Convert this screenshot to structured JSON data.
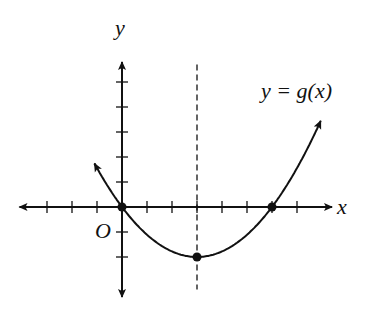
{
  "chart_data": {
    "type": "line",
    "title": "",
    "function_label": "y = g(x)",
    "xlabel": "x",
    "ylabel": "y",
    "origin_label": "O",
    "xlim": [
      -4,
      8
    ],
    "ylim": [
      -3,
      6
    ],
    "x_ticks": [
      -3,
      -2,
      -1,
      1,
      2,
      3,
      4,
      5,
      6,
      7
    ],
    "y_ticks": [
      -2,
      -1,
      1,
      2,
      3,
      4,
      5
    ],
    "grid": false,
    "axis_of_symmetry": {
      "x": 3,
      "style": "dashed"
    },
    "marked_points": [
      {
        "x": 0,
        "y": 0
      },
      {
        "x": 3,
        "y": -2
      },
      {
        "x": 6,
        "y": 0
      }
    ],
    "series": [
      {
        "name": "y = g(x)",
        "kind": "parabola",
        "vertex": [
          3,
          -2
        ],
        "roots": [
          0,
          6
        ],
        "equation": "g(x) = (2/9)(x-3)^2 - 2"
      }
    ]
  }
}
